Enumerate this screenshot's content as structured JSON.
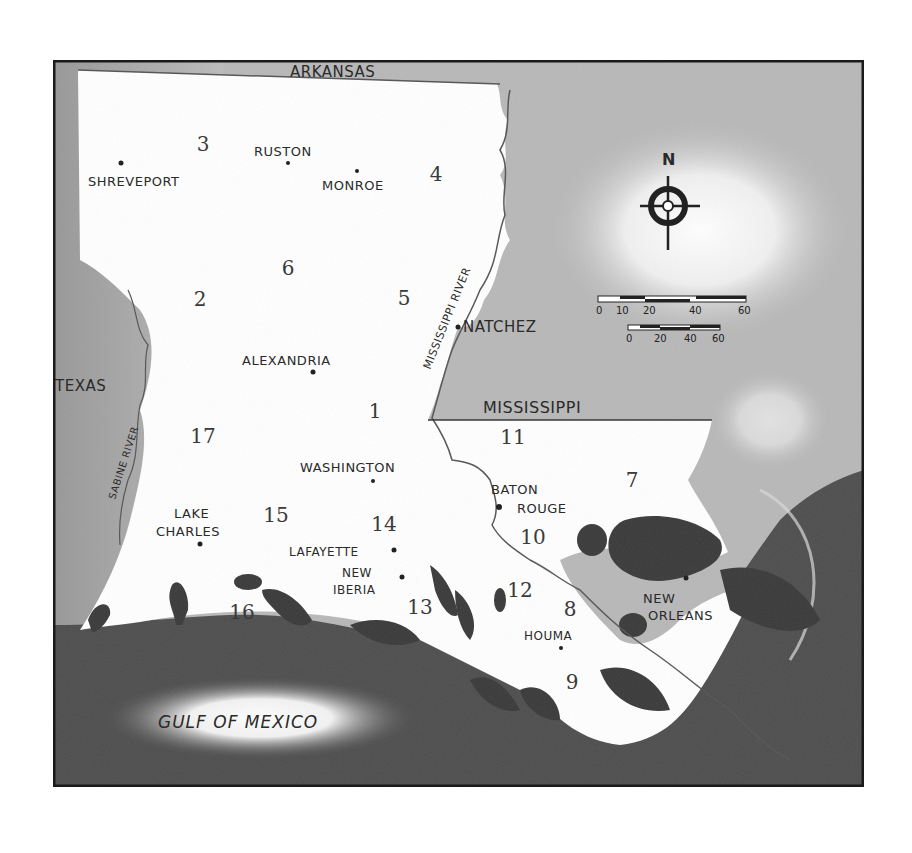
{
  "map": {
    "title": "Louisiana",
    "states": [
      {
        "id": "arkansas",
        "label": "ARKANSAS",
        "x": 290,
        "y": 17,
        "size": 15
      },
      {
        "id": "texas",
        "label": "TEXAS",
        "x": 30,
        "y": 331,
        "size": 15
      },
      {
        "id": "mississippi",
        "label": "MISSISSIPPI",
        "x": 485,
        "y": 354,
        "size": 16
      }
    ],
    "water": [
      {
        "id": "gulf-of-mexico",
        "label": "GULF OF MEXICO",
        "x": 210,
        "y": 725,
        "size": 17
      }
    ],
    "rivers": [
      {
        "id": "mississippi-river",
        "label": "MISSISSIPPI RIVER"
      },
      {
        "id": "sabine-river",
        "label": "SABINE RIVER"
      }
    ],
    "cities": [
      {
        "id": "shreveport",
        "label": "SHREVEPORT",
        "dot": [
          121,
          163
        ],
        "lx": 88,
        "ly": 186
      },
      {
        "id": "ruston",
        "label": "RUSTON",
        "dot": [
          288,
          163
        ],
        "lx": 254,
        "ly": 156
      },
      {
        "id": "monroe",
        "label": "MONROE",
        "dot": [
          357,
          171
        ],
        "lx": 322,
        "ly": 190
      },
      {
        "id": "natchez",
        "label": "NATCHEZ",
        "dot": [
          458,
          327
        ],
        "lx": 463,
        "ly": 332
      },
      {
        "id": "alexandria",
        "label": "ALEXANDRIA",
        "dot": [
          313,
          372
        ],
        "lx": 242,
        "ly": 365
      },
      {
        "id": "washington",
        "label": "WASHINGTON",
        "dot": [
          373,
          481
        ],
        "lx": 300,
        "ly": 472
      },
      {
        "id": "lake-charles",
        "label": "LAKE CHARLES",
        "lines": [
          "LAKE",
          "CHARLES"
        ],
        "dot": [
          200,
          544
        ],
        "lx": 174,
        "ly": 518
      },
      {
        "id": "lafayette",
        "label": "LAFAYETTE",
        "dot": [
          394,
          550
        ],
        "lx": 289,
        "ly": 556
      },
      {
        "id": "new-iberia",
        "label": "NEW IBERIA",
        "lines": [
          "NEW",
          "IBERIA"
        ],
        "dot": [
          402,
          577
        ],
        "lx": 340,
        "ly": 577
      },
      {
        "id": "baton-rouge",
        "label": "BATON ROUGE",
        "lines": [
          "BATON",
          "ROUGE"
        ],
        "dot": [
          499,
          506
        ],
        "lx": 491,
        "ly": 494
      },
      {
        "id": "houma",
        "label": "HOUMA",
        "dot": [
          561,
          648
        ],
        "lx": 524,
        "ly": 640
      },
      {
        "id": "new-orleans",
        "label": "NEW ORLEANS",
        "lines": [
          "NEW",
          "ORLEANS"
        ],
        "dot": [
          686,
          578
        ],
        "lx": 645,
        "ly": 603
      }
    ],
    "regions": [
      {
        "id": "1",
        "label": "1",
        "x": 375,
        "y": 418
      },
      {
        "id": "2",
        "label": "2",
        "x": 200,
        "y": 306
      },
      {
        "id": "3",
        "label": "3",
        "x": 203,
        "y": 151
      },
      {
        "id": "4",
        "label": "4",
        "x": 436,
        "y": 181
      },
      {
        "id": "5",
        "label": "5",
        "x": 404,
        "y": 305
      },
      {
        "id": "6",
        "label": "6",
        "x": 288,
        "y": 275
      },
      {
        "id": "7",
        "label": "7",
        "x": 632,
        "y": 487
      },
      {
        "id": "8",
        "label": "8",
        "x": 570,
        "y": 616
      },
      {
        "id": "9",
        "label": "9",
        "x": 572,
        "y": 689
      },
      {
        "id": "10",
        "label": "10",
        "x": 533,
        "y": 544
      },
      {
        "id": "11",
        "label": "11",
        "x": 513,
        "y": 444
      },
      {
        "id": "12",
        "label": "12",
        "x": 520,
        "y": 597
      },
      {
        "id": "13",
        "label": "13",
        "x": 420,
        "y": 614
      },
      {
        "id": "14",
        "label": "14",
        "x": 384,
        "y": 531
      },
      {
        "id": "15",
        "label": "15",
        "x": 276,
        "y": 522
      },
      {
        "id": "16",
        "label": "16",
        "x": 242,
        "y": 619
      },
      {
        "id": "17",
        "label": "17",
        "x": 203,
        "y": 443
      }
    ],
    "compass": {
      "label": "N",
      "cx": 668,
      "cy": 206
    },
    "scale_bars": [
      {
        "id": "miles",
        "ticks": [
          "0",
          "10",
          "20",
          "40",
          "60"
        ]
      },
      {
        "id": "kilometers",
        "ticks": [
          "0",
          "20",
          "40",
          "60"
        ]
      }
    ],
    "colors": {
      "land": "#ffffff",
      "neighbor_states": "#b9b9b9",
      "gulf": "#4a4a4a",
      "marsh": "#3a3a3a",
      "frame": "#1a1a1a"
    }
  }
}
